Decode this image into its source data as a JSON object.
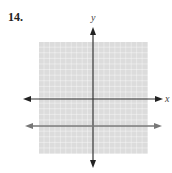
{
  "problem": {
    "number": "14."
  },
  "graph": {
    "x_axis_label": "x",
    "y_axis_label": "y",
    "grid": {
      "cells_x": 20,
      "cells_y": 20,
      "x_range": [
        -10,
        10
      ],
      "y_range": [
        -10,
        10
      ]
    },
    "lines": [
      {
        "name": "horizontal-line",
        "equation": "y = -5",
        "color": "#777777"
      }
    ],
    "colors": {
      "grid_background": "#dcdcdc",
      "grid_lines": "#ffffff",
      "axes": "#333333",
      "line": "#777777"
    }
  }
}
